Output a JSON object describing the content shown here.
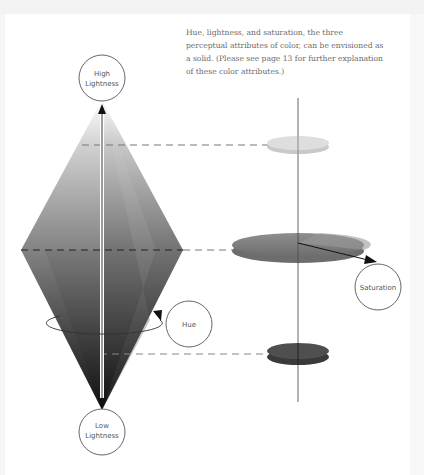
{
  "caption": "Hue, lightness, and saturation, the three perceptual attributes of color, can be envisioned as a solid. (Please see page 13 for further explanation of these color attributes.)",
  "labels": {
    "high_lightness_line1": "High",
    "high_lightness_line2": "Lightness",
    "low_lightness_line1": "Low",
    "low_lightness_line2": "Lightness",
    "hue": "Hue",
    "saturation": "Saturation"
  },
  "colors": {
    "disk_top": "#d4d4d4",
    "disk_middle": "#8a8a8a",
    "disk_bottom": "#4a4a4a",
    "outline": "#555555"
  }
}
